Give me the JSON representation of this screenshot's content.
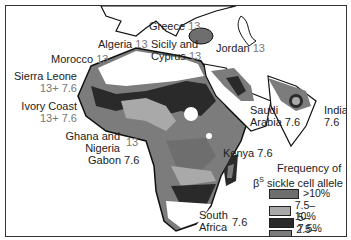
{
  "map": {
    "title": "Frequency of sickle cell allele",
    "legend": {
      "title_line1": "Frequency of",
      "title_symbol": "β",
      "title_superscript": "S",
      "title_line2": " sickle cell allele",
      "items": [
        {
          "label": ">10%",
          "color": "#6e6e6e"
        },
        {
          "label": "7.5–10%",
          "color": "#a9a9a9"
        },
        {
          "label": "5–7.5%",
          "color": "#2a2a2a"
        },
        {
          "label": "2.5–5%",
          "color": "#7c7c7c"
        },
        {
          "label": "0–2.5%",
          "color": "#ffffff"
        }
      ]
    },
    "labels": [
      {
        "id": "greece",
        "name": "Greece",
        "values": "13"
      },
      {
        "id": "algeria",
        "name": "Algeria",
        "values": "13"
      },
      {
        "id": "sicily",
        "name": "Sicily and",
        "name2": "Cyprus",
        "values": "13"
      },
      {
        "id": "jordan",
        "name": "Jordan",
        "values": "13"
      },
      {
        "id": "morocco",
        "name": "Morocco",
        "values": "13"
      },
      {
        "id": "sierra-leone",
        "name": "Sierra Leone",
        "values": "13+ 7.6"
      },
      {
        "id": "ivory-coast",
        "name": "Ivory Coast",
        "values": "13+ 7.6"
      },
      {
        "id": "saudi-arabia",
        "name": "Saudi",
        "name2": "Arabia",
        "values": "7.6"
      },
      {
        "id": "india",
        "name": "India",
        "values": "7.6"
      },
      {
        "id": "ghana-nigeria",
        "name": "Ghana and",
        "name2": "Nigeria",
        "values": "13"
      },
      {
        "id": "gabon",
        "name": "Gabon",
        "values": "7.6"
      },
      {
        "id": "kenya",
        "name": "Kenya",
        "values": "7.6"
      },
      {
        "id": "south-africa",
        "name": "South",
        "name2": "Africa",
        "values": "7.6"
      }
    ]
  }
}
